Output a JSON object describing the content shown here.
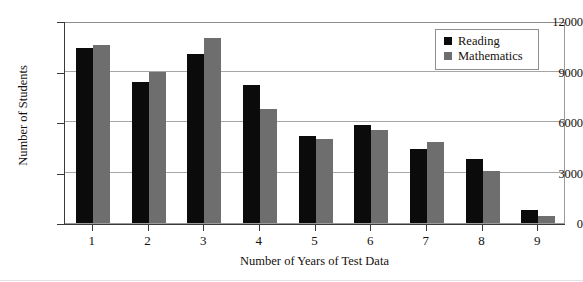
{
  "chart_data": {
    "type": "bar",
    "title": "",
    "xlabel": "Number of Years of Test Data",
    "ylabel": "Number of Students",
    "categories": [
      "1",
      "2",
      "3",
      "4",
      "5",
      "6",
      "7",
      "8",
      "9"
    ],
    "series": [
      {
        "name": "Reading",
        "color": "#0b0b0b",
        "values": [
          10400,
          8400,
          10050,
          8200,
          5150,
          5850,
          4400,
          3800,
          800
        ]
      },
      {
        "name": "Mathematics",
        "color": "#6e6e6e",
        "values": [
          10550,
          9000,
          11000,
          6800,
          5000,
          5550,
          4800,
          3100,
          400
        ]
      }
    ],
    "ylim": [
      0,
      12000
    ],
    "yticks": [
      0,
      3000,
      6000,
      9000,
      12000
    ],
    "ytick_labels": [
      "0",
      "3000",
      "6000",
      "9000",
      "12000"
    ],
    "grid": true,
    "grid_axis": "y",
    "legend_position": "top-right"
  },
  "axes": {
    "y_title": "Number of Students",
    "x_title": "Number of Years of Test Data"
  },
  "legend": {
    "entries": [
      {
        "label": "Reading",
        "color": "#0b0b0b"
      },
      {
        "label": "Mathematics",
        "color": "#6e6e6e"
      }
    ]
  }
}
